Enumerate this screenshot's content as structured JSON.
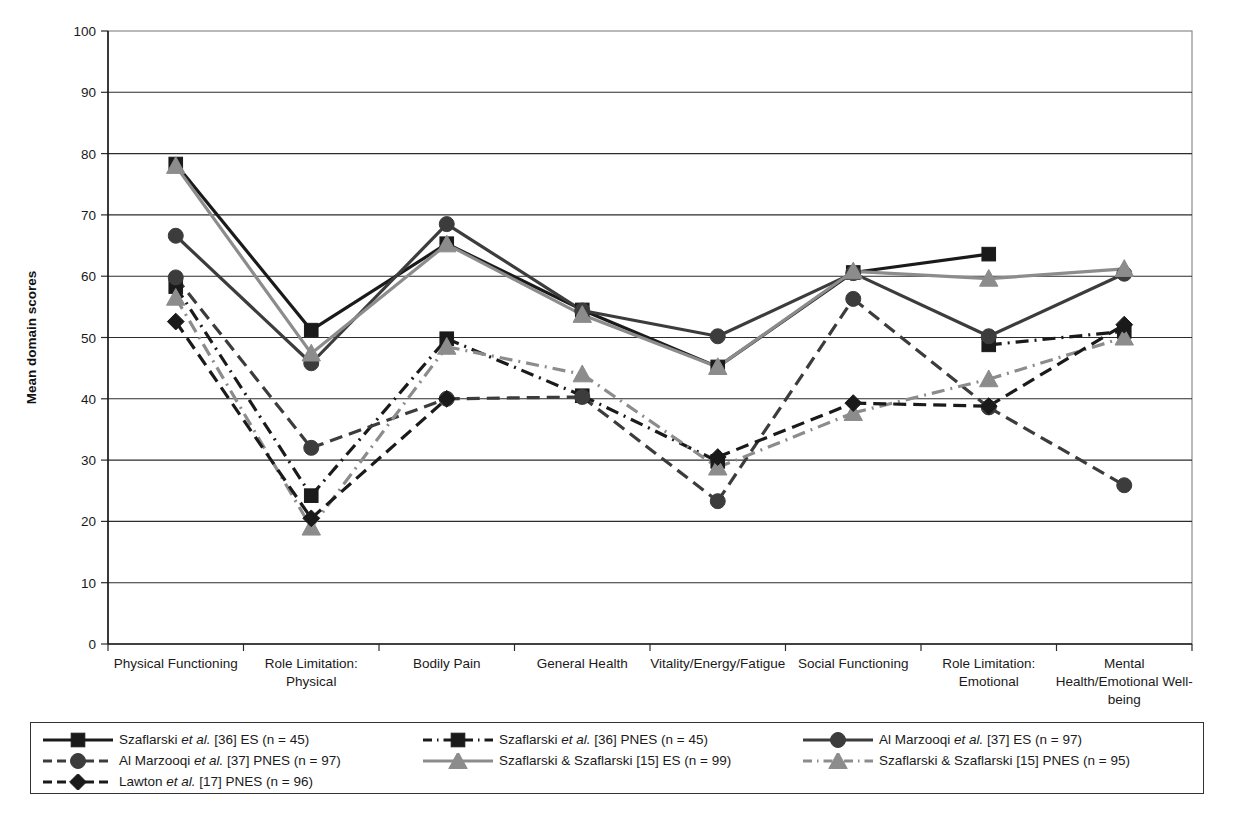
{
  "chart_data": {
    "type": "line",
    "title": "",
    "xlabel": "",
    "ylabel": "Mean domain scores",
    "ylim": [
      0,
      100
    ],
    "ytick_step": 10,
    "grid": true,
    "legend_position": "below",
    "categories": [
      "Physical Functioning",
      "Role Limitation: Physical",
      "Bodily Pain",
      "General Health",
      "Vitality/Energy/Fatigue",
      "Social Functioning",
      "Role Limitation: Emotional",
      "Mental Health/Emotional Well-being"
    ],
    "category_lines": [
      [
        "Physical Functioning"
      ],
      [
        "Role Limitation:",
        "Physical"
      ],
      [
        "Bodily Pain"
      ],
      [
        "General Health"
      ],
      [
        "Vitality/Energy/Fatigue"
      ],
      [
        "Social Functioning"
      ],
      [
        "Role Limitation:",
        "Emotional"
      ],
      [
        "Mental",
        "Health/Emotional Well-",
        "being"
      ]
    ],
    "ytick_labels": [
      "0",
      "10",
      "20",
      "30",
      "40",
      "50",
      "60",
      "70",
      "80",
      "90",
      "100"
    ],
    "series": [
      {
        "name": "Szaflarski et al. [36] ES (n = 45)",
        "key": "szaflarski36_es",
        "color": "#1a1a1a",
        "marker": "square",
        "dash": "solid",
        "values": [
          78.3,
          51.2,
          65.3,
          54.5,
          45.2,
          60.6,
          63.6,
          null
        ]
      },
      {
        "name": "Szaflarski et al. [36] PNES (n = 45)",
        "key": "szaflarski36_pnes",
        "color": "#1a1a1a",
        "marker": "square",
        "dash": "dashdot",
        "values": [
          58.3,
          24.2,
          49.8,
          40.5,
          29.8,
          null,
          48.8,
          51.0
        ]
      },
      {
        "name": "Al Marzooqi et al. [37] ES (n = 97)",
        "key": "almarzooqi37_es",
        "color": "#3c3c3c",
        "marker": "circle",
        "dash": "solid",
        "values": [
          66.6,
          45.8,
          68.5,
          54.4,
          50.2,
          60.5,
          50.2,
          60.4
        ]
      },
      {
        "name": "Al Marzooqi et al. [37] PNES (n = 97)",
        "key": "almarzooqi37_pnes",
        "color": "#3c3c3c",
        "marker": "circle",
        "dash": "dashed",
        "values": [
          59.8,
          32.0,
          40.0,
          40.3,
          23.3,
          56.3,
          38.6,
          25.9
        ]
      },
      {
        "name": "Szaflarski & Szaflarski [15] ES (n = 99)",
        "key": "szafszaf15_es",
        "color": "#8c8c8c",
        "marker": "triangle",
        "dash": "solid",
        "values": [
          78.0,
          47.4,
          65.2,
          53.7,
          45.2,
          60.8,
          59.6,
          61.2
        ]
      },
      {
        "name": "Szaflarski & Szaflarski [15] PNES (n = 95)",
        "key": "szafszaf15_pnes",
        "color": "#8c8c8c",
        "marker": "triangle",
        "dash": "dashdot",
        "values": [
          56.5,
          19.0,
          48.5,
          44.0,
          28.8,
          37.7,
          43.2,
          50.0
        ]
      },
      {
        "name": "Lawton et al. [17] PNES (n = 96)",
        "key": "lawton17_pnes",
        "color": "#1a1a1a",
        "marker": "diamond",
        "dash": "dashed",
        "values": [
          52.6,
          20.5,
          40.0,
          null,
          30.5,
          39.3,
          38.8,
          52.1
        ]
      }
    ]
  },
  "axis": {
    "y_title": "Mean domain scores"
  },
  "legend": {
    "items": [
      {
        "label_pre": "Szaflarski ",
        "label_it": "et al.",
        "label_post": " [36] ES (n = 45)",
        "series_key": "szaflarski36_es"
      },
      {
        "label_pre": "Szaflarski ",
        "label_it": "et al.",
        "label_post": " [36] PNES (n = 45)",
        "series_key": "szaflarski36_pnes"
      },
      {
        "label_pre": "Al Marzooqi ",
        "label_it": "et al.",
        "label_post": " [37] ES (n = 97)",
        "series_key": "almarzooqi37_es"
      },
      {
        "label_pre": "Al Marzooqi ",
        "label_it": "et al.",
        "label_post": " [37] PNES (n = 97)",
        "series_key": "almarzooqi37_pnes"
      },
      {
        "label_pre": "Szaflarski & Szaflarski [15] ES (n = 99)",
        "label_it": "",
        "label_post": "",
        "series_key": "szafszaf15_es"
      },
      {
        "label_pre": "Szaflarski & Szaflarski [15] PNES (n = 95)",
        "label_it": "",
        "label_post": "",
        "series_key": "szafszaf15_pnes"
      },
      {
        "label_pre": "Lawton ",
        "label_it": "et al.",
        "label_post": " [17] PNES (n = 96)",
        "series_key": "lawton17_pnes"
      }
    ]
  },
  "caption": ""
}
